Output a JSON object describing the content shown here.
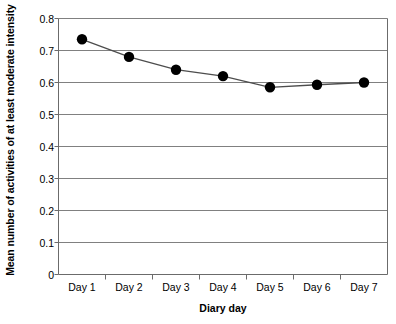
{
  "chart_data": {
    "type": "line",
    "title": "",
    "xlabel": "Diary day",
    "ylabel": "Mean number of activities of at least moderate intensity",
    "categories": [
      "Day 1",
      "Day 2",
      "Day 3",
      "Day 4",
      "Day 5",
      "Day 6",
      "Day 7"
    ],
    "values": [
      0.735,
      0.68,
      0.64,
      0.62,
      0.585,
      0.593,
      0.6
    ],
    "series": [
      {
        "name": "Mean number of activities of at least moderate intensity",
        "values": [
          0.735,
          0.68,
          0.64,
          0.62,
          0.585,
          0.593,
          0.6
        ]
      }
    ],
    "ylim": [
      0,
      0.8
    ],
    "yticks": [
      0,
      0.1,
      0.2,
      0.3,
      0.4,
      0.5,
      0.6,
      0.7,
      0.8
    ],
    "ytick_labels": [
      "0",
      "0.1",
      "0.2",
      "0.3",
      "0.4",
      "0.5",
      "0.6",
      "0.7",
      "0.8"
    ],
    "grid": true,
    "grid_axis": "y",
    "legend": "none",
    "marker": "filled-circle",
    "marker_color": "#000000",
    "line_color": "#4d4d4d",
    "grid_color": "#808080",
    "axis_color": "#6b6b6b",
    "background_color": "#ffffff"
  }
}
